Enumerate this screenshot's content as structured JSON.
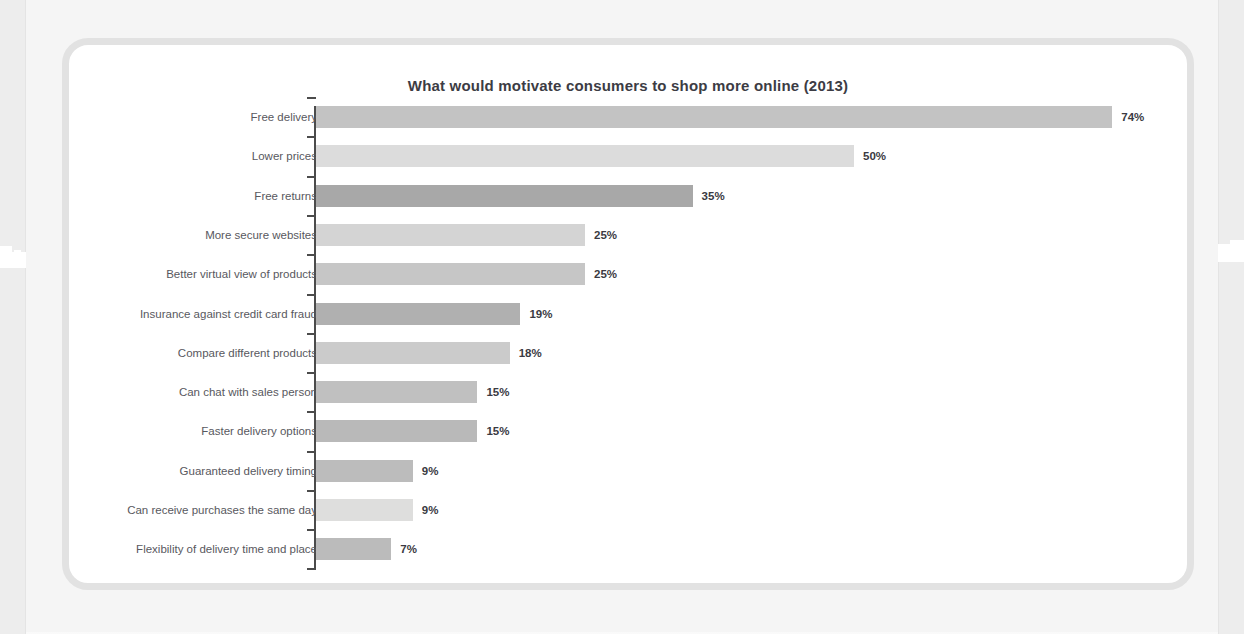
{
  "chart_data": {
    "type": "bar",
    "orientation": "horizontal",
    "title": "What would motivate consumers to shop more online (2013)",
    "xlabel": "",
    "ylabel": "",
    "xlim": [
      0,
      74
    ],
    "grid": false,
    "legend": null,
    "value_suffix": "%",
    "categories": [
      "Free delivery",
      "Lower prices",
      "Free returns",
      "More secure websites",
      "Better virtual view of products",
      "Insurance against credit card fraud",
      "Compare different products",
      "Can chat with sales person",
      "Faster delivery options",
      "Guaranteed delivery timing",
      "Can receive purchases the same day",
      "Flexibility of delivery time and place"
    ],
    "values": [
      74,
      50,
      35,
      25,
      25,
      19,
      18,
      15,
      15,
      9,
      9,
      7
    ],
    "value_labels": [
      "74%",
      "50%",
      "35%",
      "25%",
      "25%",
      "19%",
      "18%",
      "15%",
      "15%",
      "9%",
      "9%",
      "7%"
    ],
    "bar_colors": [
      "#c3c3c3",
      "#dcdcdc",
      "#a8a8a8",
      "#d4d4d4",
      "#c6c6c6",
      "#b0b0b0",
      "#cbcbcb",
      "#c0c0c0",
      "#b9b9b9",
      "#bcbcbc",
      "#dededd",
      "#bbbbbb"
    ]
  },
  "style": {
    "page_background": "#f5f5f5",
    "card_background": "#ffffff",
    "card_border": "#e2e2e2",
    "title_color": "#3c3c44",
    "label_color": "#58585e",
    "value_color": "#3a3a42",
    "axis_color": "#4b4b4b"
  }
}
